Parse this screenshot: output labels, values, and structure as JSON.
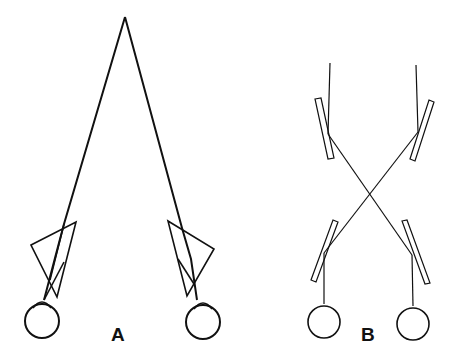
{
  "panels": [
    {
      "id": "A",
      "label": "A",
      "description": "Two eyes viewing through prisms converging to a single far point"
    },
    {
      "id": "B",
      "label": "B",
      "description": "Two eyes viewing via crossed mirror pairs (mirror stereoscope)"
    }
  ],
  "colors": {
    "stroke": "#111111",
    "background": "#ffffff"
  }
}
